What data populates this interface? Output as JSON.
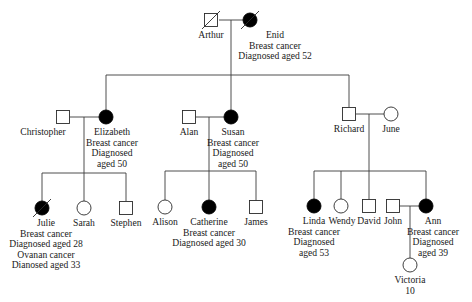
{
  "diagram": {
    "type": "pedigree",
    "colors": {
      "affected": "#000000",
      "unaffected": "#ffffff",
      "line": "#3a3a3a",
      "text": "#1a1a1a"
    },
    "individuals": [
      {
        "id": "arthur",
        "name": "Arthur",
        "sex": "male",
        "affected": false,
        "deceased": true,
        "x": 211,
        "y": 20,
        "labels": [
          "Arthur"
        ],
        "label_x": 211,
        "label_anchor": "middle"
      },
      {
        "id": "enid",
        "name": "Enid",
        "sex": "female",
        "affected": true,
        "deceased": true,
        "x": 250,
        "y": 20,
        "labels": [
          "Enid",
          "Breast cancer",
          "Diagnosed aged 52"
        ],
        "label_x": 275,
        "label_anchor": "middle"
      },
      {
        "id": "christopher",
        "name": "Christopher",
        "sex": "male",
        "affected": false,
        "deceased": false,
        "x": 63,
        "y": 117,
        "labels": [
          "Christopher"
        ],
        "label_x": 43,
        "label_anchor": "middle"
      },
      {
        "id": "elizabeth",
        "name": "Elizabeth",
        "sex": "female",
        "affected": true,
        "deceased": false,
        "x": 106,
        "y": 117,
        "labels": [
          "Elizabeth",
          "Breast cancer",
          "Diagnosed",
          "aged 50"
        ],
        "label_x": 112,
        "label_anchor": "middle"
      },
      {
        "id": "alan",
        "name": "Alan",
        "sex": "male",
        "affected": false,
        "deceased": false,
        "x": 189,
        "y": 117,
        "labels": [
          "Alan"
        ],
        "label_x": 189,
        "label_anchor": "middle"
      },
      {
        "id": "susan",
        "name": "Susan",
        "sex": "female",
        "affected": true,
        "deceased": false,
        "x": 231,
        "y": 117,
        "labels": [
          "Susan",
          "Breast cancer",
          "Diagnosed",
          "aged 50"
        ],
        "label_x": 233,
        "label_anchor": "middle"
      },
      {
        "id": "richard",
        "name": "Richard",
        "sex": "male",
        "affected": false,
        "deceased": false,
        "x": 349,
        "y": 114,
        "labels": [
          "Richard"
        ],
        "label_x": 349,
        "label_anchor": "middle"
      },
      {
        "id": "june",
        "name": "June",
        "sex": "female",
        "affected": false,
        "deceased": false,
        "x": 391,
        "y": 114,
        "labels": [
          "June"
        ],
        "label_x": 391,
        "label_anchor": "middle"
      },
      {
        "id": "julie",
        "name": "Julie",
        "sex": "female",
        "affected": true,
        "deceased": true,
        "x": 42,
        "y": 208,
        "labels": [
          "Julie",
          "Breast cancer",
          "Diagnosed aged 28",
          "Ovanan cancer",
          "Dianosed aged 33"
        ],
        "label_x": 46,
        "label_anchor": "middle"
      },
      {
        "id": "sarah",
        "name": "Sarah",
        "sex": "female",
        "affected": false,
        "deceased": false,
        "x": 84,
        "y": 208,
        "labels": [
          "Sarah"
        ],
        "label_x": 84,
        "label_anchor": "middle"
      },
      {
        "id": "stephen",
        "name": "Stephen",
        "sex": "male",
        "affected": false,
        "deceased": false,
        "x": 126,
        "y": 208,
        "labels": [
          "Stephen"
        ],
        "label_x": 126,
        "label_anchor": "middle"
      },
      {
        "id": "alison",
        "name": "Alison",
        "sex": "female",
        "affected": false,
        "deceased": false,
        "x": 165,
        "y": 207,
        "labels": [
          "Alison"
        ],
        "label_x": 165,
        "label_anchor": "middle"
      },
      {
        "id": "catherine",
        "name": "Catherine",
        "sex": "female",
        "affected": true,
        "deceased": false,
        "x": 209,
        "y": 207,
        "labels": [
          "Catherine",
          "Breast cancer",
          "Diagnosed aged 30"
        ],
        "label_x": 209,
        "label_anchor": "middle"
      },
      {
        "id": "james",
        "name": "James",
        "sex": "male",
        "affected": false,
        "deceased": false,
        "x": 256,
        "y": 207,
        "labels": [
          "James"
        ],
        "label_x": 256,
        "label_anchor": "middle"
      },
      {
        "id": "linda",
        "name": "Linda",
        "sex": "female",
        "affected": true,
        "deceased": false,
        "x": 314,
        "y": 206,
        "labels": [
          "Linda",
          "Breast cancer",
          "Diagnosed",
          "aged 53"
        ],
        "label_x": 314,
        "label_anchor": "middle"
      },
      {
        "id": "wendy",
        "name": "Wendy",
        "sex": "female",
        "affected": false,
        "deceased": false,
        "x": 341,
        "y": 206,
        "labels": [
          "Wendy"
        ],
        "label_x": 342,
        "label_anchor": "middle"
      },
      {
        "id": "david",
        "name": "David",
        "sex": "male",
        "affected": false,
        "deceased": false,
        "x": 369,
        "y": 206,
        "labels": [
          "David"
        ],
        "label_x": 369,
        "label_anchor": "middle"
      },
      {
        "id": "john",
        "name": "John",
        "sex": "male",
        "affected": false,
        "deceased": false,
        "x": 393,
        "y": 206,
        "labels": [
          "John"
        ],
        "label_x": 393,
        "label_anchor": "middle"
      },
      {
        "id": "ann",
        "name": "Ann",
        "sex": "female",
        "affected": true,
        "deceased": false,
        "x": 426,
        "y": 206,
        "labels": [
          "Ann",
          "Breast cancer",
          "Diagnosed",
          "aged 39"
        ],
        "label_x": 433,
        "label_anchor": "middle"
      },
      {
        "id": "victoria",
        "name": "Victoria",
        "sex": "female",
        "affected": false,
        "deceased": false,
        "x": 410,
        "y": 265,
        "labels": [
          "Victoria",
          "10"
        ],
        "label_x": 410,
        "label_anchor": "middle"
      }
    ],
    "lines": [
      {
        "id": "marriage-arthur-enid",
        "x1": 219,
        "y1": 20,
        "x2": 243,
        "y2": 20
      },
      {
        "id": "drop-gen1",
        "x1": 231,
        "y1": 20,
        "x2": 231,
        "y2": 75
      },
      {
        "id": "sibship-gen2",
        "x1": 106,
        "y1": 75,
        "x2": 349,
        "y2": 75
      },
      {
        "id": "to-elizabeth",
        "x1": 106,
        "y1": 75,
        "x2": 106,
        "y2": 110
      },
      {
        "id": "to-susan",
        "x1": 231,
        "y1": 75,
        "x2": 231,
        "y2": 110
      },
      {
        "id": "to-richard",
        "x1": 349,
        "y1": 75,
        "x2": 349,
        "y2": 107
      },
      {
        "id": "marriage-christopher-elizabeth",
        "x1": 70,
        "y1": 117,
        "x2": 99,
        "y2": 117
      },
      {
        "id": "drop-elizabeth",
        "x1": 84,
        "y1": 117,
        "x2": 84,
        "y2": 173
      },
      {
        "id": "sibship-elizabeth",
        "x1": 42,
        "y1": 173,
        "x2": 126,
        "y2": 173
      },
      {
        "id": "to-julie",
        "x1": 42,
        "y1": 173,
        "x2": 42,
        "y2": 201
      },
      {
        "id": "to-sarah",
        "x1": 84,
        "y1": 173,
        "x2": 84,
        "y2": 201
      },
      {
        "id": "to-stephen",
        "x1": 126,
        "y1": 173,
        "x2": 126,
        "y2": 201
      },
      {
        "id": "marriage-alan-susan",
        "x1": 195,
        "y1": 117,
        "x2": 224,
        "y2": 117
      },
      {
        "id": "drop-susan",
        "x1": 209,
        "y1": 117,
        "x2": 209,
        "y2": 171
      },
      {
        "id": "sibship-susan",
        "x1": 165,
        "y1": 171,
        "x2": 256,
        "y2": 171
      },
      {
        "id": "to-alison",
        "x1": 165,
        "y1": 171,
        "x2": 165,
        "y2": 200
      },
      {
        "id": "to-catherine",
        "x1": 209,
        "y1": 171,
        "x2": 209,
        "y2": 200
      },
      {
        "id": "to-james",
        "x1": 256,
        "y1": 171,
        "x2": 256,
        "y2": 201
      },
      {
        "id": "marriage-richard-june",
        "x1": 356,
        "y1": 114,
        "x2": 384,
        "y2": 114
      },
      {
        "id": "drop-richard",
        "x1": 369,
        "y1": 114,
        "x2": 369,
        "y2": 171
      },
      {
        "id": "sibship-richard",
        "x1": 314,
        "y1": 171,
        "x2": 426,
        "y2": 171
      },
      {
        "id": "to-linda",
        "x1": 314,
        "y1": 171,
        "x2": 314,
        "y2": 199
      },
      {
        "id": "to-wendy",
        "x1": 341,
        "y1": 171,
        "x2": 341,
        "y2": 199
      },
      {
        "id": "to-david",
        "x1": 369,
        "y1": 171,
        "x2": 369,
        "y2": 200
      },
      {
        "id": "to-ann",
        "x1": 426,
        "y1": 171,
        "x2": 426,
        "y2": 199
      },
      {
        "id": "marriage-john-ann",
        "x1": 399,
        "y1": 206,
        "x2": 419,
        "y2": 206
      },
      {
        "id": "drop-ann",
        "x1": 410,
        "y1": 206,
        "x2": 410,
        "y2": 258
      }
    ]
  }
}
